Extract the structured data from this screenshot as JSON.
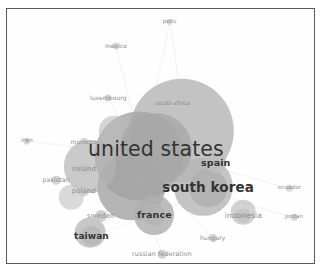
{
  "figure": {
    "kind": "network-map",
    "title": "",
    "frame_color": "#59595e",
    "background_color": "#ffffff"
  },
  "chart_data": {
    "type": "scatter",
    "title": "",
    "xlabel": "",
    "ylabel": "",
    "grid": false,
    "legend": "none",
    "xlim": [
      0,
      100
    ],
    "ylim": [
      0,
      100
    ],
    "nodes": [
      {
        "label": "united states",
        "x": 48.5,
        "y": 55.0,
        "size": 100,
        "font": 20.5,
        "weight": "400",
        "color": "#a8a8a8"
      },
      {
        "label": "south korea",
        "x": 65.5,
        "y": 70.5,
        "size": 52,
        "font": 13.5,
        "weight": "700",
        "color": "#b0b0b0"
      },
      {
        "label": "spain",
        "x": 68.0,
        "y": 60.5,
        "size": 30,
        "font": 9.5,
        "weight": "700",
        "color": "#bdbdbd"
      },
      {
        "label": "france",
        "x": 48.0,
        "y": 81.0,
        "size": 30,
        "font": 9.5,
        "weight": "700",
        "color": "#b4b4b4"
      },
      {
        "label": "taiwan",
        "x": 27.5,
        "y": 89.5,
        "size": 28,
        "font": 9.0,
        "weight": "700",
        "color": "#b8b8b8"
      },
      {
        "label": "indonesia",
        "x": 77.0,
        "y": 81.5,
        "size": 20,
        "font": 7.5,
        "weight": "400",
        "color": "#c2c2c2"
      },
      {
        "label": "sweden",
        "x": 30.5,
        "y": 81.5,
        "size": 17,
        "font": 7.0,
        "weight": "400",
        "color": "#c4c4c4"
      },
      {
        "label": "poland",
        "x": 25.0,
        "y": 71.5,
        "size": 16,
        "font": 6.8,
        "weight": "400",
        "color": "#c6c6c6"
      },
      {
        "label": "ireland",
        "x": 25.0,
        "y": 63.0,
        "size": 15,
        "font": 6.8,
        "weight": "400",
        "color": "#c6c6c6"
      },
      {
        "label": "pakistan",
        "x": 16.0,
        "y": 67.5,
        "size": 12,
        "font": 6.2,
        "weight": "400",
        "color": "#cacaca"
      },
      {
        "label": "morocco",
        "x": 25.0,
        "y": 52.5,
        "size": 11,
        "font": 6.0,
        "weight": "400",
        "color": "#cbcbcb"
      },
      {
        "label": "hungary",
        "x": 67.0,
        "y": 90.0,
        "size": 11,
        "font": 6.0,
        "weight": "400",
        "color": "#cbcbcb"
      },
      {
        "label": "russian federation",
        "x": 50.5,
        "y": 96.5,
        "size": 12,
        "font": 6.4,
        "weight": "400",
        "color": "#c9c9c9"
      },
      {
        "label": "iran",
        "x": 6.5,
        "y": 52.0,
        "size": 9,
        "font": 5.8,
        "weight": "400",
        "color": "#cdcdcd"
      },
      {
        "label": "ecuador",
        "x": 92.0,
        "y": 70.5,
        "size": 9,
        "font": 5.6,
        "weight": "400",
        "color": "#cecece"
      },
      {
        "label": "jordan",
        "x": 93.5,
        "y": 82.0,
        "size": 9,
        "font": 5.6,
        "weight": "400",
        "color": "#cecece"
      },
      {
        "label": "southafrica",
        "x": 54.0,
        "y": 37.0,
        "size": 10,
        "font": 6.0,
        "weight": "400",
        "color": "#cdcdcd"
      },
      {
        "label": "luxembourg",
        "x": 33.0,
        "y": 35.0,
        "size": 10,
        "font": 6.0,
        "weight": "400",
        "color": "#cdcdcd"
      },
      {
        "label": "mexico",
        "x": 35.5,
        "y": 14.5,
        "size": 10,
        "font": 6.0,
        "weight": "400",
        "color": "#cdcdcd"
      },
      {
        "label": "peru",
        "x": 53.0,
        "y": 5.0,
        "size": 9,
        "font": 5.8,
        "weight": "400",
        "color": "#cecece"
      }
    ],
    "blobs": [
      {
        "x": 57.0,
        "y": 48.0,
        "r": 17.0,
        "color": "#b9b9b9",
        "opacity": 0.85
      },
      {
        "x": 43.0,
        "y": 58.0,
        "r": 14.5,
        "color": "#a9a9a9",
        "opacity": 0.85
      },
      {
        "x": 40.5,
        "y": 70.0,
        "r": 11.0,
        "color": "#a3a3a3",
        "opacity": 0.8
      },
      {
        "x": 64.0,
        "y": 70.0,
        "r": 9.5,
        "color": "#b6b6b6",
        "opacity": 0.8
      },
      {
        "x": 27.0,
        "y": 62.0,
        "r": 8.5,
        "color": "#b5b5b5",
        "opacity": 0.7
      },
      {
        "x": 48.0,
        "y": 81.0,
        "r": 6.5,
        "color": "#aeaeae",
        "opacity": 0.8
      },
      {
        "x": 27.0,
        "y": 88.0,
        "r": 5.0,
        "color": "#b5b5b5",
        "opacity": 0.75
      },
      {
        "x": 77.0,
        "y": 80.0,
        "r": 4.0,
        "color": "#c0c0c0",
        "opacity": 0.7
      },
      {
        "x": 35.0,
        "y": 48.0,
        "r": 5.0,
        "color": "#bdbdbd",
        "opacity": 0.6
      },
      {
        "x": 21.0,
        "y": 74.0,
        "r": 4.0,
        "color": "#c2c2c2",
        "opacity": 0.6
      }
    ]
  }
}
